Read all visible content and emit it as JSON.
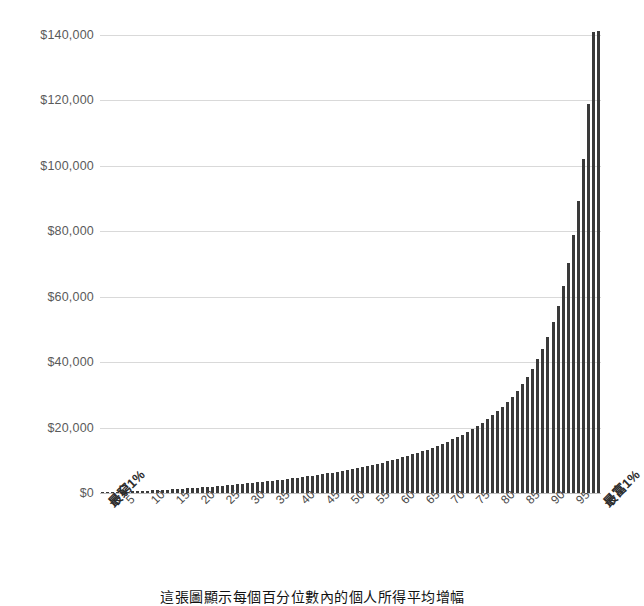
{
  "chart_data": {
    "type": "bar",
    "title": "",
    "subtitle": "",
    "xlabel": "",
    "ylabel": "",
    "caption": "這張圖顯示每個百分位數內的個人所得平均增幅",
    "grid": true,
    "legend": null,
    "ylim": [
      0,
      140000
    ],
    "ytick_values": [
      0,
      20000,
      40000,
      60000,
      80000,
      100000,
      120000,
      140000
    ],
    "ytick_labels": [
      "$0",
      "$20,000",
      "$40,000",
      "$60,000",
      "$80,000",
      "$100,000",
      "$120,000",
      "$140,000"
    ],
    "xlim_percentiles": [
      1,
      100
    ],
    "xtick_labels": [
      "最窮1%",
      "5",
      "10",
      "15",
      "20",
      "25",
      "30",
      "35",
      "40",
      "45",
      "50",
      "55",
      "60",
      "65",
      "70",
      "75",
      "80",
      "85",
      "90",
      "95",
      "最富1%"
    ],
    "xtick_percentiles": [
      1,
      5,
      10,
      15,
      20,
      25,
      30,
      35,
      40,
      45,
      50,
      55,
      60,
      65,
      70,
      75,
      80,
      85,
      90,
      95,
      100
    ],
    "bar_color": "#3a3a3a",
    "grid_color": "#d9d9d9",
    "categories": [
      1,
      2,
      3,
      4,
      5,
      6,
      7,
      8,
      9,
      10,
      11,
      12,
      13,
      14,
      15,
      16,
      17,
      18,
      19,
      20,
      21,
      22,
      23,
      24,
      25,
      26,
      27,
      28,
      29,
      30,
      31,
      32,
      33,
      34,
      35,
      36,
      37,
      38,
      39,
      40,
      41,
      42,
      43,
      44,
      45,
      46,
      47,
      48,
      49,
      50,
      51,
      52,
      53,
      54,
      55,
      56,
      57,
      58,
      59,
      60,
      61,
      62,
      63,
      64,
      65,
      66,
      67,
      68,
      69,
      70,
      71,
      72,
      73,
      74,
      75,
      76,
      77,
      78,
      79,
      80,
      81,
      82,
      83,
      84,
      85,
      86,
      87,
      88,
      89,
      90,
      91,
      92,
      93,
      94,
      95,
      96,
      97,
      98,
      99,
      100
    ],
    "values": [
      120,
      180,
      240,
      300,
      360,
      430,
      500,
      570,
      640,
      720,
      800,
      880,
      960,
      1050,
      1140,
      1230,
      1330,
      1430,
      1530,
      1640,
      1750,
      1860,
      1980,
      2100,
      2230,
      2360,
      2490,
      2630,
      2770,
      2920,
      3070,
      3230,
      3390,
      3560,
      3730,
      3910,
      4090,
      4280,
      4470,
      4670,
      4880,
      5090,
      5310,
      5540,
      5770,
      6010,
      6260,
      6520,
      6790,
      7060,
      7350,
      7640,
      7950,
      8270,
      8600,
      8940,
      9300,
      9670,
      10060,
      10460,
      10880,
      11320,
      11780,
      12260,
      12760,
      13290,
      13840,
      14430,
      15040,
      15690,
      16380,
      17110,
      17880,
      18700,
      19570,
      20500,
      21500,
      22570,
      23730,
      24980,
      26340,
      27830,
      29460,
      31260,
      33260,
      35490,
      38000,
      40840,
      44080,
      47810,
      52140,
      57200,
      63160,
      70250,
      78790,
      89230,
      102250,
      118910,
      141000,
      141200
    ],
    "highlight_notes": {
      "top_bar_value": 141000,
      "second_bar_value": 35000
    }
  }
}
